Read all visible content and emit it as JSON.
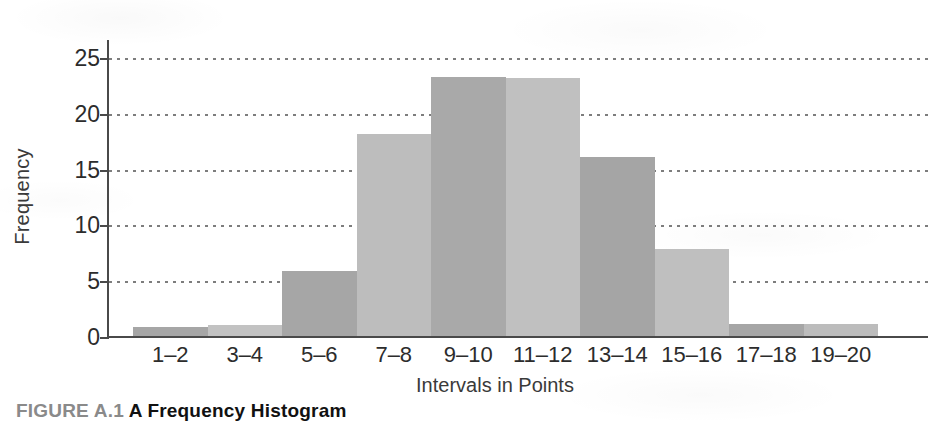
{
  "figure": {
    "caption_number": "FIGURE A.1",
    "caption_title": "A Frequency Histogram"
  },
  "chart_data": {
    "type": "bar",
    "title": "A Frequency Histogram",
    "xlabel": "Intervals in Points",
    "ylabel": "Frequency",
    "categories": [
      "1–2",
      "3–4",
      "5–6",
      "7–8",
      "9–10",
      "11–12",
      "13–14",
      "15–16",
      "17–18",
      "19–20"
    ],
    "values": [
      1,
      1.2,
      6,
      18.3,
      23.4,
      23.3,
      16.2,
      8,
      1.3,
      1.3
    ],
    "ylim": [
      0,
      25
    ],
    "yticks": [
      0,
      5,
      10,
      15,
      20,
      25
    ],
    "ytick_labels": [
      "0",
      "5",
      "10",
      "15",
      "20",
      "25"
    ],
    "grid": "horizontal-dotted",
    "legend": "none",
    "bar_colors": [
      "#a6a6a6",
      "#c2c2c2",
      "#a6a6a6",
      "#bdbdbd",
      "#a9a9a9",
      "#c0c0c0",
      "#a5a5a5",
      "#bfbfbf",
      "#a6a6a6",
      "#bcbcbc"
    ],
    "axis_color": "#4a4a4a",
    "grid_color": "#7d7d7d"
  }
}
